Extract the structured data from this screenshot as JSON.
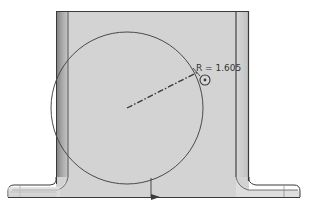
{
  "drawing": {
    "type": "cad-sketch",
    "view": "front view of bracket part with sketched circle",
    "dimension": {
      "label": "R = 1.605",
      "kind": "radius",
      "value": 1.605
    },
    "colors": {
      "part_face": "#d2d2d2",
      "wall_shade_dark": "#8a8a8a",
      "wall_shade_light": "#c8c8c8",
      "outline": "#3a3a3a",
      "sketch_line": "#4a4a4a",
      "background": "#ffffff"
    },
    "elements": [
      {
        "name": "bracket-body",
        "description": "U-shaped bracket with two vertical walls and bottom flanges"
      },
      {
        "name": "sketch-circle",
        "description": "large circle sketched on face"
      },
      {
        "name": "radius-centerline",
        "description": "dash-dot radius line from circle center"
      },
      {
        "name": "handle-marker",
        "description": "small circular grip on circle edge"
      },
      {
        "name": "origin-arrow",
        "description": "small arrow on bottom edge"
      }
    ]
  }
}
